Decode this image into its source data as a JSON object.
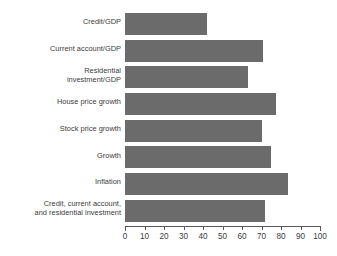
{
  "chart_data": {
    "type": "bar",
    "orientation": "horizontal",
    "title": "",
    "subtitle": "",
    "xlabel": "",
    "ylabel": "",
    "xlim": [
      0,
      100
    ],
    "grid": false,
    "legend": false,
    "bar_color": "#6b6b6b",
    "axis_color": "#5a5a5a",
    "text_color": "#3b3b3b",
    "background": "#ffffff",
    "xticks": [
      0,
      10,
      20,
      30,
      40,
      50,
      60,
      70,
      80,
      90,
      100
    ],
    "xtick_labels": [
      "0",
      "10",
      "20",
      "30",
      "40",
      "50",
      "60",
      "70",
      "80",
      "90",
      "100"
    ],
    "categories": [
      "Credit/GDP",
      "Current account/GDP",
      "Residential\ninvestment/GDP",
      "House price growth",
      "Stock price growth",
      "Growth",
      "Inflation",
      "Credit, current account,\nand residential investment"
    ],
    "values": [
      42,
      71,
      63,
      77.5,
      70,
      75,
      83.5,
      72
    ]
  }
}
